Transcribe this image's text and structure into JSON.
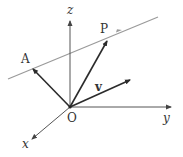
{
  "diagram": {
    "colors": {
      "axis": "#555555",
      "vector": "#2b2b2b",
      "line": "#9a9a9a",
      "text": "#333333"
    },
    "labels": {
      "origin": "O",
      "x_axis": "x",
      "y_axis": "y",
      "z_axis": "z",
      "point_a": "A",
      "point_p": "P",
      "vector_v": "v"
    }
  }
}
